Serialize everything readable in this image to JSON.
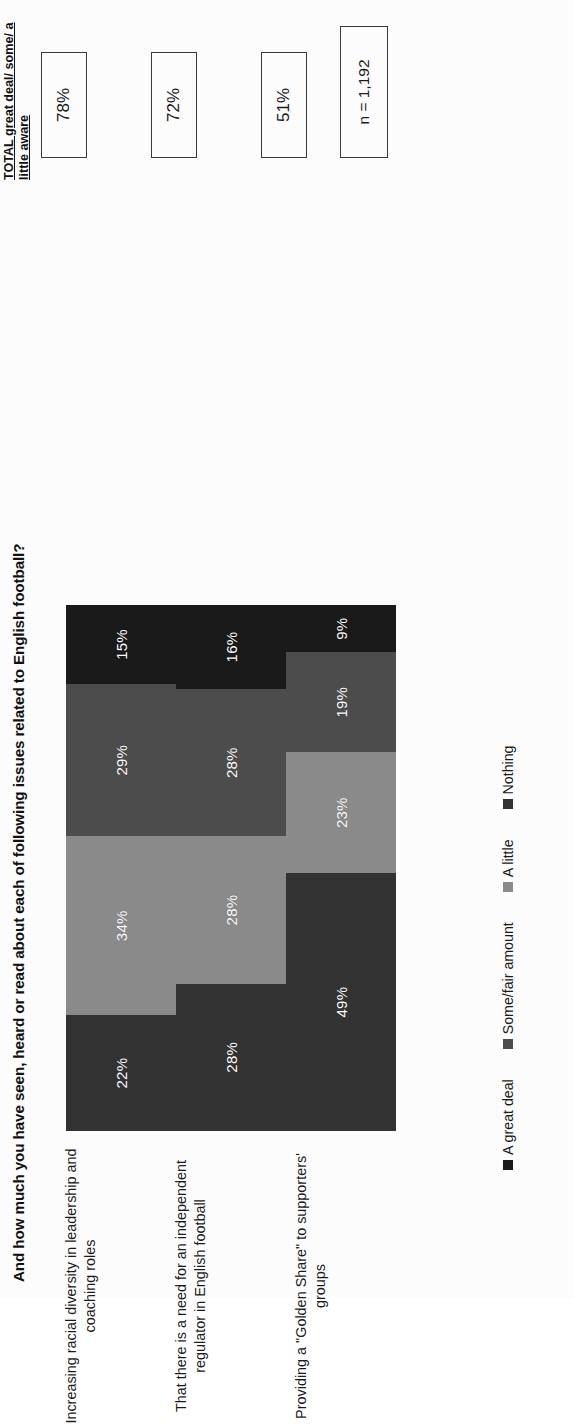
{
  "title": "And how much you have seen, heard or read about each of following issues related to English football?",
  "total_header": "TOTAL great deal/ some/ a little aware",
  "sample_note": "n = 1,192",
  "categories": [
    "Increasing racial diversity in leadership and coaching roles",
    "That there is a need for an independent regulator in English football",
    "Providing a \"Golden Share\" to supporters' groups"
  ],
  "totals": [
    "78%",
    "72%",
    "51%"
  ],
  "legend": [
    {
      "label": "A great deal",
      "color": "#1a1a1a"
    },
    {
      "label": "Some/fair amount",
      "color": "#4d4d4d"
    },
    {
      "label": "A little",
      "color": "#8c8c8c"
    },
    {
      "label": "Nothing",
      "color": "#333333"
    }
  ],
  "bars": [
    {
      "category": "Increasing racial diversity in leadership and coaching roles",
      "total": "78%",
      "segments": [
        {
          "series": "A great deal",
          "label": "15%",
          "value": 15,
          "color": "#1a1a1a"
        },
        {
          "series": "Some/fair amount",
          "label": "29%",
          "value": 29,
          "color": "#4d4d4d"
        },
        {
          "series": "A little",
          "label": "34%",
          "value": 34,
          "color": "#8c8c8c"
        },
        {
          "series": "Nothing",
          "label": "22%",
          "value": 22,
          "color": "#333333"
        }
      ]
    },
    {
      "category": "That there is a need for an independent regulator in English football",
      "total": "72%",
      "segments": [
        {
          "series": "A great deal",
          "label": "16%",
          "value": 16,
          "color": "#1a1a1a"
        },
        {
          "series": "Some/fair amount",
          "label": "28%",
          "value": 28,
          "color": "#4d4d4d"
        },
        {
          "series": "A little",
          "label": "28%",
          "value": 28,
          "color": "#8c8c8c"
        },
        {
          "series": "Nothing",
          "label": "28%",
          "value": 28,
          "color": "#333333"
        }
      ]
    },
    {
      "category": "Providing a \"Golden Share\" to supporters' groups",
      "total": "51%",
      "segments": [
        {
          "series": "A great deal",
          "label": "9%",
          "value": 9,
          "color": "#1a1a1a"
        },
        {
          "series": "Some/fair amount",
          "label": "19%",
          "value": 19,
          "color": "#4d4d4d"
        },
        {
          "series": "A little",
          "label": "23%",
          "value": 23,
          "color": "#8c8c8c"
        },
        {
          "series": "Nothing",
          "label": "49%",
          "value": 49,
          "color": "#333333"
        }
      ]
    }
  ],
  "chart_data": {
    "type": "bar",
    "title": "And how much you have seen, heard or read about each of following issues related to English football?",
    "subtitle": "",
    "orientation": "horizontal",
    "stacked": true,
    "stack_mode": "percent",
    "xlabel": "",
    "ylabel": "",
    "xlim": [
      0,
      100
    ],
    "grid": false,
    "legend_position": "bottom",
    "rotation_degrees": -90,
    "categories": [
      "Increasing racial diversity in leadership and coaching roles",
      "That there is a need for an independent regulator in English football",
      "Providing a \"Golden Share\" to supporters' groups"
    ],
    "series": [
      {
        "name": "A great deal",
        "color": "#1a1a1a",
        "values": [
          15,
          16,
          9
        ]
      },
      {
        "name": "Some/fair amount",
        "color": "#4d4d4d",
        "values": [
          29,
          28,
          19
        ]
      },
      {
        "name": "A little",
        "color": "#8c8c8c",
        "values": [
          34,
          28,
          23
        ]
      },
      {
        "name": "Nothing",
        "color": "#333333",
        "values": [
          22,
          28,
          49
        ]
      }
    ],
    "annotations": {
      "total_column_header": "TOTAL great deal/ some/ a little aware",
      "totals": [
        78,
        72,
        51
      ],
      "total_labels": [
        "78%",
        "72%",
        "51%"
      ],
      "sample_size": "n = 1,192"
    },
    "data_labels": [
      [
        "15%",
        "29%",
        "34%",
        "22%"
      ],
      [
        "16%",
        "28%",
        "28%",
        "28%"
      ],
      [
        "9%",
        "19%",
        "23%",
        "49%"
      ]
    ]
  }
}
